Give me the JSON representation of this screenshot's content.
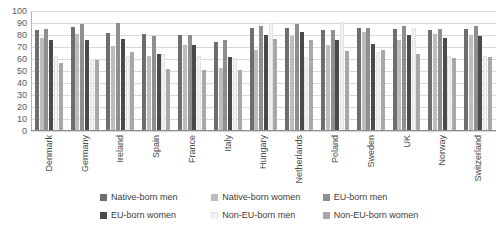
{
  "chart_data": {
    "type": "bar",
    "title": "",
    "subtitle": "",
    "xlabel": "",
    "ylabel": "",
    "ylim": [
      0,
      100
    ],
    "ytick_step": 10,
    "yticks": [
      100,
      90,
      80,
      70,
      60,
      50,
      40,
      30,
      20,
      10,
      0
    ],
    "grid": true,
    "legend_position": "bottom",
    "categories": [
      "Denmark",
      "Germany",
      "Ireland",
      "Spain",
      "France",
      "Italy",
      "Hungary",
      "Netherlands",
      "Poland",
      "Sweden",
      "UK",
      "Norway",
      "Switzerland"
    ],
    "series": [
      {
        "name": "Native-born men",
        "color": "#6e6e6e",
        "values": [
          83,
          86,
          81,
          80,
          79,
          73,
          85,
          85,
          83,
          85,
          84,
          83,
          84
        ]
      },
      {
        "name": "Native-born women",
        "color": "#bdbdbd",
        "values": [
          77,
          80,
          70,
          62,
          71,
          52,
          67,
          78,
          71,
          82,
          75,
          80,
          79
        ]
      },
      {
        "name": "EU-born men",
        "color": "#8f8f8f",
        "values": [
          84,
          88,
          89,
          78,
          79,
          75,
          87,
          88,
          83,
          85,
          87,
          84,
          87
        ]
      },
      {
        "name": "EU-born women",
        "color": "#4a4a4a",
        "values": [
          75,
          75,
          76,
          63,
          71,
          61,
          79,
          82,
          75,
          72,
          79,
          77,
          78
        ]
      },
      {
        "name": "Non-EU-born men",
        "color": "#f2f2f2",
        "values": [
          62,
          59,
          62,
          63,
          62,
          60,
          89,
          61,
          90,
          65,
          85,
          62,
          62
        ]
      },
      {
        "name": "Non-EU-born women",
        "color": "#a8a8a8",
        "values": [
          56,
          58,
          65,
          51,
          50,
          50,
          76,
          75,
          66,
          67,
          63,
          60,
          61
        ]
      }
    ]
  },
  "legend": {
    "items": [
      {
        "label": "Native-born men"
      },
      {
        "label": "Native-born women"
      },
      {
        "label": "EU-born men"
      },
      {
        "label": "EU-born women"
      },
      {
        "label": "Non-EU-born men"
      },
      {
        "label": "Non-EU-born women"
      }
    ]
  }
}
